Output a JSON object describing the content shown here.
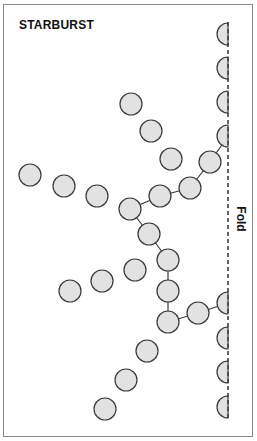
{
  "title": "STARBURST",
  "fold_label": "Fold",
  "colors": {
    "circle_fill": "#e2e2e2",
    "circle_stroke": "#3a3a3a",
    "border": "#8a8a8a",
    "text": "#111111"
  },
  "fold_line": {
    "x": 228,
    "y1": 22,
    "y2": 418
  },
  "circle_radius": 11,
  "half_circles": [
    {
      "cx": 228,
      "cy": 34
    },
    {
      "cx": 228,
      "cy": 68
    },
    {
      "cx": 228,
      "cy": 102
    },
    {
      "cx": 228,
      "cy": 136
    },
    {
      "cx": 228,
      "cy": 303
    },
    {
      "cx": 228,
      "cy": 338
    },
    {
      "cx": 228,
      "cy": 372
    },
    {
      "cx": 228,
      "cy": 407
    }
  ],
  "circles": [
    {
      "cx": 131,
      "cy": 104
    },
    {
      "cx": 151,
      "cy": 131
    },
    {
      "cx": 171,
      "cy": 159
    },
    {
      "cx": 210,
      "cy": 162
    },
    {
      "cx": 190,
      "cy": 188
    },
    {
      "cx": 160,
      "cy": 196
    },
    {
      "cx": 130,
      "cy": 209
    },
    {
      "cx": 30,
      "cy": 175
    },
    {
      "cx": 64,
      "cy": 186
    },
    {
      "cx": 97,
      "cy": 196
    },
    {
      "cx": 149,
      "cy": 234
    },
    {
      "cx": 168,
      "cy": 260
    },
    {
      "cx": 168,
      "cy": 291
    },
    {
      "cx": 168,
      "cy": 322
    },
    {
      "cx": 198,
      "cy": 313
    },
    {
      "cx": 135,
      "cy": 270
    },
    {
      "cx": 102,
      "cy": 281
    },
    {
      "cx": 70,
      "cy": 291
    },
    {
      "cx": 147,
      "cy": 351
    },
    {
      "cx": 126,
      "cy": 380
    },
    {
      "cx": 105,
      "cy": 409
    }
  ],
  "connectors": [
    [
      228,
      136,
      210,
      162
    ],
    [
      210,
      162,
      190,
      188
    ],
    [
      190,
      188,
      160,
      196
    ],
    [
      160,
      196,
      130,
      209
    ],
    [
      130,
      209,
      149,
      234
    ],
    [
      149,
      234,
      168,
      260
    ],
    [
      168,
      260,
      168,
      291
    ],
    [
      168,
      291,
      168,
      322
    ],
    [
      168,
      322,
      198,
      313
    ],
    [
      198,
      313,
      228,
      303
    ]
  ]
}
